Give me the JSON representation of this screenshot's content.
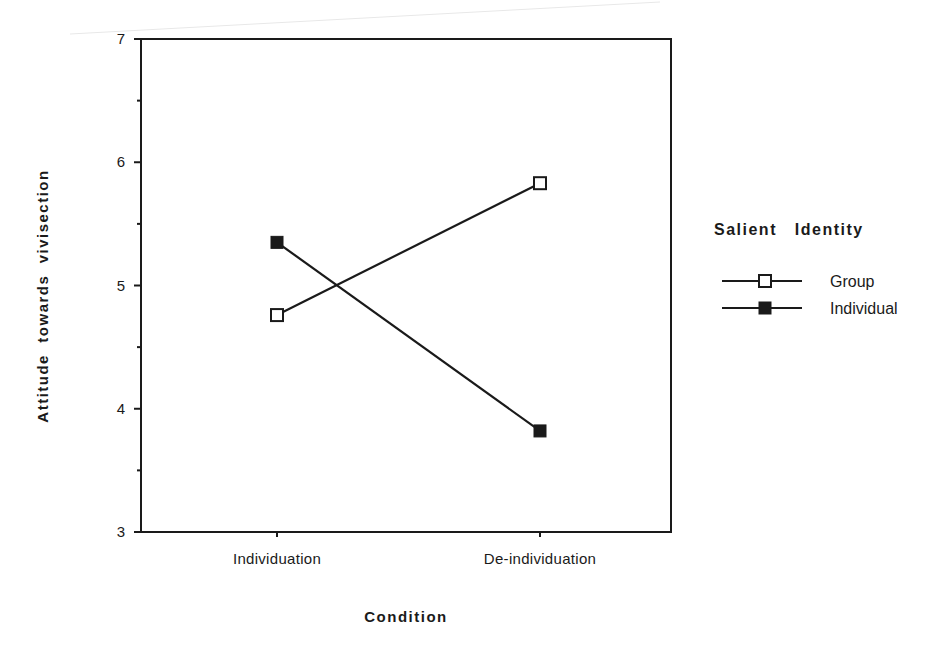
{
  "chart_data": {
    "type": "line",
    "title": "",
    "xlabel": "Condition",
    "ylabel": "Attitude towards vivisection",
    "categories": [
      "Individuation",
      "De-individuation"
    ],
    "series": [
      {
        "name": "Group",
        "marker": "open-square",
        "values": [
          4.76,
          5.83
        ]
      },
      {
        "name": "Individual",
        "marker": "filled-square",
        "values": [
          5.35,
          3.82
        ]
      }
    ],
    "ylim": [
      3,
      7
    ],
    "yticks": [
      3,
      4,
      5,
      6,
      7
    ],
    "yminor_ticks": [
      3.5,
      4.5,
      5.5,
      6.5
    ],
    "grid": false,
    "legend": {
      "title": "Salient identity",
      "position": "right"
    }
  },
  "labels": {
    "xlabel": "Condition",
    "ylabel": "Attitude  towards  vivisection",
    "legend_title": "Salient   Identity",
    "legend_items": [
      "Group",
      "Individual"
    ],
    "categories": [
      "Individuation",
      "De-individuation"
    ],
    "yticks": [
      "3",
      "4",
      "5",
      "6",
      "7"
    ]
  },
  "colors": {
    "ink": "#1a1a1a",
    "background": "#ffffff",
    "open_marker_fill": "#ffffff"
  }
}
